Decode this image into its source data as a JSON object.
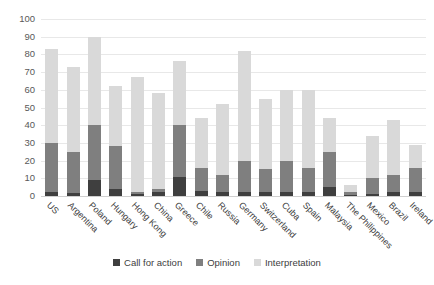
{
  "chart_data": {
    "type": "bar",
    "stacked": true,
    "title": "",
    "xlabel": "",
    "ylabel": "",
    "ylim": [
      0,
      100
    ],
    "ytick_step": 10,
    "yticks": [
      0,
      10,
      20,
      30,
      40,
      50,
      60,
      70,
      80,
      90,
      100
    ],
    "grid": true,
    "legend_position": "bottom",
    "categories": [
      "US",
      "Argentina",
      "Poland",
      "Hungary",
      "Hong Kong",
      "China",
      "Greece",
      "Chile",
      "Russia",
      "Germany",
      "Switzerland",
      "Cuba",
      "Spain",
      "Malaysia",
      "The Philippines",
      "Mexico",
      "Brazil",
      "Ireland"
    ],
    "series": [
      {
        "name": "Call for action",
        "color": "#3f3f3f",
        "values": [
          2,
          1.5,
          9,
          4,
          1,
          2,
          11,
          3,
          2,
          2,
          2,
          2,
          2,
          5,
          0.5,
          1,
          2,
          2
        ]
      },
      {
        "name": "Opinion",
        "color": "#7f7f7f",
        "values": [
          28,
          23.5,
          31,
          24,
          1,
          2,
          29,
          13,
          10,
          18,
          13,
          18,
          14,
          20,
          1.5,
          9,
          10,
          14
        ]
      },
      {
        "name": "Interpretation",
        "color": "#d9d9d9",
        "values": [
          53,
          48,
          50,
          34,
          65,
          54,
          36,
          28,
          40,
          62,
          40,
          40,
          44,
          19,
          4,
          24,
          31,
          13
        ]
      }
    ],
    "totals": [
      83,
      73,
      90,
      62,
      67,
      58,
      76,
      44,
      52,
      82,
      55,
      60,
      60,
      44,
      6,
      34,
      43,
      29
    ]
  },
  "legend": {
    "items": [
      {
        "label": "Call for action",
        "color": "#3f3f3f"
      },
      {
        "label": "Opinion",
        "color": "#7f7f7f"
      },
      {
        "label": "Interpretation",
        "color": "#d9d9d9"
      }
    ]
  },
  "colors": {
    "call_for_action": "#3f3f3f",
    "opinion": "#7f7f7f",
    "interpretation": "#d9d9d9",
    "gridline": "#e8e8e8",
    "axis_text": "#595959",
    "background": "#ffffff"
  }
}
